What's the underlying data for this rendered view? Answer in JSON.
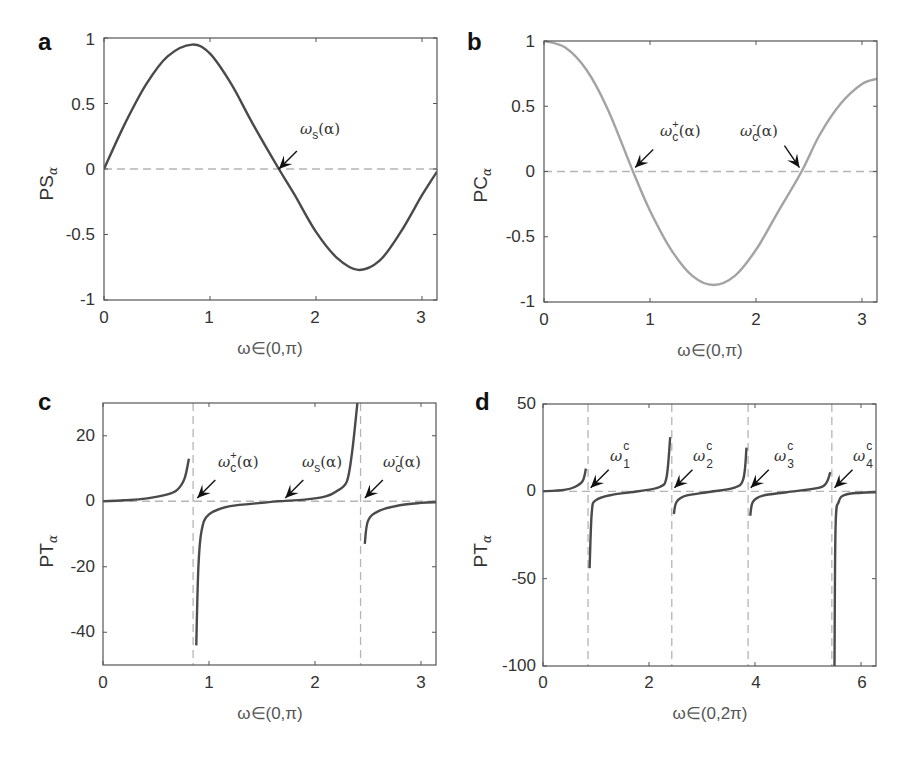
{
  "colors": {
    "curve_dark": "#4a4a4a",
    "curve_light": "#a3a3a3",
    "dashed_line": "#b5b5b5",
    "axes": "#555555",
    "arrow": "#111111"
  },
  "panels": {
    "a": {
      "letter": "a",
      "ylabel_main": "PS",
      "ylabel_sub": "α",
      "xlabel": "ω∈(0,π)",
      "yticks": [
        "1",
        "0.5",
        "0",
        "-0.5",
        "-1"
      ],
      "xticks": [
        "0",
        "1",
        "2",
        "3"
      ],
      "annotation": {
        "symbol": "ω",
        "sub": "s",
        "arg": "(α)"
      }
    },
    "b": {
      "letter": "b",
      "ylabel_main": "PC",
      "ylabel_sub": "α",
      "xlabel": "ω∈(0,π)",
      "yticks": [
        "1",
        "0.5",
        "0",
        "-0.5",
        "-1"
      ],
      "xticks": [
        "0",
        "1",
        "2",
        "3"
      ],
      "annotation_plus": {
        "symbol": "ω",
        "sub": "c",
        "sup": "+",
        "arg": "(α)"
      },
      "annotation_minus": {
        "symbol": "ω",
        "sub": "c",
        "sup": "-",
        "arg": "(α)"
      }
    },
    "c": {
      "letter": "c",
      "ylabel_main": "PT",
      "ylabel_sub": "α",
      "xlabel": "ω∈(0,π)",
      "yticks": [
        "20",
        "0",
        "-20",
        "-40"
      ],
      "xticks": [
        "0",
        "1",
        "2",
        "3"
      ],
      "annotation_plus": {
        "symbol": "ω",
        "sub": "c",
        "sup": "+",
        "arg": "(α)"
      },
      "annotation_s": {
        "symbol": "ω",
        "sub": "s",
        "arg": "(α)"
      },
      "annotation_minus": {
        "symbol": "ω",
        "sub": "c",
        "sup": "-",
        "arg": "(α)"
      }
    },
    "d": {
      "letter": "d",
      "ylabel_main": "PT",
      "ylabel_sub": "α",
      "xlabel": "ω∈(0,2π)",
      "yticks": [
        "50",
        "0",
        "-50",
        "-100"
      ],
      "xticks": [
        "0",
        "2",
        "4",
        "6"
      ],
      "annotations": [
        {
          "symbol": "ω",
          "sup": "c",
          "sub": "1"
        },
        {
          "symbol": "ω",
          "sup": "c",
          "sub": "2"
        },
        {
          "symbol": "ω",
          "sup": "c",
          "sub": "3"
        },
        {
          "symbol": "ω",
          "sup": "c",
          "sub": "4"
        }
      ]
    }
  },
  "chart_data": [
    {
      "panel": "a",
      "type": "line",
      "title": "",
      "xlabel": "ω∈(0,π)",
      "ylabel": "PS_α",
      "xlim": [
        0,
        3.1416
      ],
      "ylim": [
        -1,
        1
      ],
      "grid": false,
      "reference_lines": [
        {
          "type": "horizontal",
          "y": 0,
          "style": "dashed"
        }
      ],
      "annotations": [
        {
          "text": "ω_s(α)",
          "x": 1.65,
          "y": 0
        }
      ],
      "series": [
        {
          "name": "PS_α",
          "color": "#4a4a4a",
          "x": [
            0,
            0.2,
            0.4,
            0.6,
            0.83,
            1.0,
            1.2,
            1.4,
            1.65,
            1.8,
            2.0,
            2.2,
            2.4,
            2.6,
            2.8,
            3.0,
            3.1416
          ],
          "y": [
            0,
            0.35,
            0.65,
            0.86,
            0.95,
            0.88,
            0.65,
            0.35,
            0.0,
            -0.2,
            -0.48,
            -0.68,
            -0.77,
            -0.7,
            -0.48,
            -0.2,
            -0.02
          ]
        }
      ]
    },
    {
      "panel": "b",
      "type": "line",
      "title": "",
      "xlabel": "ω∈(0,π)",
      "ylabel": "PC_α",
      "xlim": [
        0,
        3.1416
      ],
      "ylim": [
        -1,
        1
      ],
      "grid": false,
      "reference_lines": [
        {
          "type": "horizontal",
          "y": 0,
          "style": "dashed"
        }
      ],
      "annotations": [
        {
          "text": "ω_c^+(α)",
          "x": 0.84,
          "y": 0
        },
        {
          "text": "ω_c^-(α)",
          "x": 2.43,
          "y": 0
        }
      ],
      "series": [
        {
          "name": "PC_α",
          "color": "#a3a3a3",
          "x": [
            0,
            0.2,
            0.4,
            0.6,
            0.84,
            1.0,
            1.2,
            1.4,
            1.6,
            1.8,
            2.0,
            2.2,
            2.43,
            2.6,
            2.8,
            3.0,
            3.1416
          ],
          "y": [
            1.0,
            0.95,
            0.78,
            0.48,
            0.0,
            -0.3,
            -0.6,
            -0.8,
            -0.87,
            -0.8,
            -0.6,
            -0.32,
            0.0,
            0.28,
            0.52,
            0.67,
            0.71
          ]
        }
      ]
    },
    {
      "panel": "c",
      "type": "line",
      "title": "",
      "xlabel": "ω∈(0,π)",
      "ylabel": "PT_α",
      "xlim": [
        0,
        3.1416
      ],
      "ylim": [
        -50,
        30
      ],
      "grid": false,
      "reference_lines": [
        {
          "type": "horizontal",
          "y": 0,
          "style": "dashed"
        },
        {
          "type": "vertical",
          "x": 0.85,
          "style": "dashed"
        },
        {
          "type": "vertical",
          "x": 2.43,
          "style": "dashed"
        }
      ],
      "annotations": [
        {
          "text": "ω_c^+(α)",
          "x": 0.85,
          "y": 0
        },
        {
          "text": "ω_s(α)",
          "x": 1.65,
          "y": 0
        },
        {
          "text": "ω_c^-(α)",
          "x": 2.43,
          "y": 0
        }
      ],
      "series": [
        {
          "name": "PT_α segment 1",
          "color": "#4a4a4a",
          "x": [
            0,
            0.2,
            0.4,
            0.6,
            0.7,
            0.77,
            0.81
          ],
          "y": [
            0,
            0.3,
            0.8,
            2,
            3.5,
            7,
            13
          ]
        },
        {
          "name": "PT_α segment 2",
          "color": "#4a4a4a",
          "x": [
            0.88,
            0.9,
            0.93,
            1.0,
            1.2,
            1.5,
            1.65,
            1.9,
            2.1,
            2.2,
            2.3,
            2.35,
            2.4
          ],
          "y": [
            -44,
            -20,
            -9,
            -4,
            -1.5,
            -0.5,
            0,
            0.5,
            1.5,
            3,
            6,
            15,
            30
          ]
        },
        {
          "name": "PT_α segment 3",
          "color": "#4a4a4a",
          "x": [
            2.47,
            2.5,
            2.6,
            2.8,
            3.0,
            3.1416
          ],
          "y": [
            -13,
            -6,
            -3,
            -1.2,
            -0.5,
            -0.3
          ]
        }
      ]
    },
    {
      "panel": "d",
      "type": "line",
      "title": "",
      "xlabel": "ω∈(0,2π)",
      "ylabel": "PT_α",
      "xlim": [
        0,
        6.2832
      ],
      "ylim": [
        -100,
        50
      ],
      "grid": false,
      "reference_lines": [
        {
          "type": "horizontal",
          "y": 0,
          "style": "dashed"
        },
        {
          "type": "vertical",
          "x": 0.85,
          "style": "dashed"
        },
        {
          "type": "vertical",
          "x": 2.43,
          "style": "dashed"
        },
        {
          "type": "vertical",
          "x": 3.87,
          "style": "dashed"
        },
        {
          "type": "vertical",
          "x": 5.45,
          "style": "dashed"
        }
      ],
      "annotations": [
        {
          "text": "ω_1^c",
          "x": 0.85,
          "y": 0
        },
        {
          "text": "ω_2^c",
          "x": 2.43,
          "y": 0
        },
        {
          "text": "ω_3^c",
          "x": 3.87,
          "y": 0
        },
        {
          "text": "ω_4^c",
          "x": 5.45,
          "y": 0
        }
      ],
      "series": [
        {
          "name": "PT_α segment 1",
          "color": "#4a4a4a",
          "x": [
            0,
            0.4,
            0.6,
            0.75,
            0.81
          ],
          "y": [
            0,
            0.8,
            2.5,
            6,
            13
          ]
        },
        {
          "name": "PT_α segment 2",
          "color": "#4a4a4a",
          "x": [
            0.88,
            0.92,
            1.0,
            1.3,
            1.8,
            2.2,
            2.33,
            2.4
          ],
          "y": [
            -44,
            -12,
            -5,
            -2,
            0,
            2.5,
            8,
            31
          ]
        },
        {
          "name": "PT_α segment 3",
          "color": "#4a4a4a",
          "x": [
            2.47,
            2.52,
            2.7,
            3.1,
            3.6,
            3.78,
            3.84
          ],
          "y": [
            -13,
            -6,
            -2.5,
            -0.5,
            2,
            7,
            25
          ]
        },
        {
          "name": "PT_α segment 4",
          "color": "#4a4a4a",
          "x": [
            3.91,
            3.96,
            4.15,
            4.6,
            5.2,
            5.35,
            5.42
          ],
          "y": [
            -14,
            -6,
            -2.5,
            -0.5,
            2,
            5,
            11
          ]
        },
        {
          "name": "PT_α segment 5",
          "color": "#4a4a4a",
          "x": [
            5.5,
            5.52,
            5.58,
            5.7,
            6.0,
            6.2832
          ],
          "y": [
            -100,
            -20,
            -6,
            -2,
            -0.8,
            -0.5
          ]
        }
      ]
    }
  ]
}
